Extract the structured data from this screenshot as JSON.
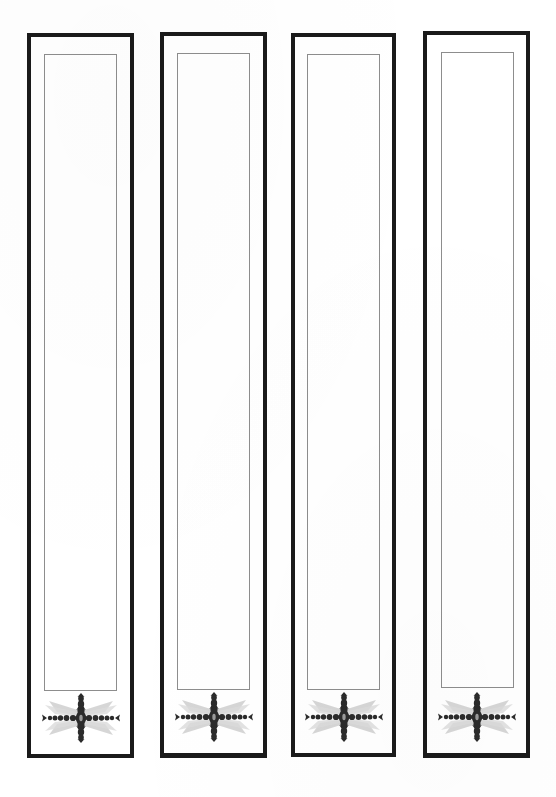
{
  "document": {
    "title": "Ornamented Panel Template Sheet",
    "background_color": "#ffffff",
    "page_width": 556,
    "page_height": 797,
    "frame_color": "#1a1a1a",
    "inner_line_color": "#8d8d8d",
    "ornament_color": "#2b2b2b",
    "ornament_shadow_color": "#c9c9c9"
  },
  "panels": [
    {
      "index": 1,
      "name": "panel-1",
      "outer_frame": {
        "x": 27,
        "y": 33,
        "width": 107,
        "height": 725
      },
      "inner_rect": {
        "inset_left": 13,
        "inset_top": 17,
        "inset_right": 13,
        "inset_bottom": 63
      },
      "ornament": {
        "name": "ornate-cross-ornament",
        "motif": "beaded-cross-with-rays",
        "width": 92,
        "height": 54
      }
    },
    {
      "index": 2,
      "name": "panel-2",
      "outer_frame": {
        "x": 160,
        "y": 32,
        "width": 107,
        "height": 726
      },
      "inner_rect": {
        "inset_left": 13,
        "inset_top": 17,
        "inset_right": 13,
        "inset_bottom": 63
      },
      "ornament": {
        "name": "ornate-cross-ornament",
        "motif": "beaded-cross-with-rays",
        "width": 92,
        "height": 54
      }
    },
    {
      "index": 3,
      "name": "panel-3",
      "outer_frame": {
        "x": 291,
        "y": 33,
        "width": 105,
        "height": 724
      },
      "inner_rect": {
        "inset_left": 12,
        "inset_top": 17,
        "inset_right": 12,
        "inset_bottom": 63
      },
      "ornament": {
        "name": "ornate-cross-ornament",
        "motif": "beaded-cross-with-rays",
        "width": 92,
        "height": 54
      }
    },
    {
      "index": 4,
      "name": "panel-4",
      "outer_frame": {
        "x": 423,
        "y": 31,
        "width": 107,
        "height": 727
      },
      "inner_rect": {
        "inset_left": 14,
        "inset_top": 17,
        "inset_right": 12,
        "inset_bottom": 65
      },
      "ornament": {
        "name": "ornate-cross-ornament",
        "motif": "beaded-cross-with-rays",
        "width": 92,
        "height": 54
      }
    }
  ]
}
